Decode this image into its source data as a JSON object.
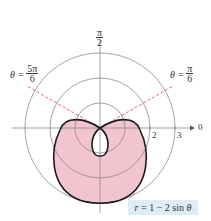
{
  "figure": {
    "equation": "r = 1 − 2 sin θ",
    "equation_parts": {
      "r": "r",
      "rest": " = 1 − 2 sin ",
      "theta": "θ"
    },
    "axis_labels": {
      "pi_over_2": {
        "num": "π",
        "den": "2"
      },
      "zero": "0"
    },
    "ticks": [
      "2",
      "3"
    ],
    "angle_lines": [
      {
        "label_prefix": "θ =",
        "num": "5π",
        "den": "6"
      },
      {
        "label_prefix": "θ =",
        "num": "π",
        "den": "6"
      }
    ],
    "colors": {
      "fill": "#f2c4cf",
      "curve": "#1a1a1a",
      "grid": "#888888",
      "dashed": "#e0506a",
      "label_bg": "#dcedf7"
    },
    "polar_grid_radii": [
      1,
      2,
      3
    ],
    "unit_px": 25,
    "center_px": [
      100,
      128
    ]
  }
}
